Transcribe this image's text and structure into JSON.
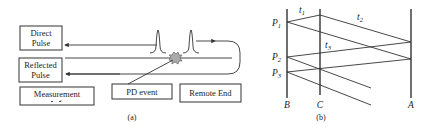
{
  "figure_a": {
    "caption": "(a)",
    "boxes": {
      "direct_pulse": [
        "Direct",
        "Pulse"
      ],
      "reflected_pulse": [
        "Reflected",
        "Pulse"
      ],
      "measurement": "Measurement",
      "pd_event": "PD event",
      "remote_end": "Remote End"
    },
    "icons": [
      "pulse-waveform-icon",
      "pulse-waveform-icon",
      "pd-event-burst-icon",
      "arrow-left-icon",
      "arrow-right-icon"
    ]
  },
  "figure_b": {
    "caption": "(b)",
    "axes": [
      "B",
      "C",
      "A"
    ],
    "points": [
      {
        "label": "P",
        "sub": "1"
      },
      {
        "label": "P",
        "sub": "2"
      },
      {
        "label": "P",
        "sub": "3"
      }
    ],
    "time_labels": [
      {
        "label": "t",
        "sub": "1"
      },
      {
        "label": "t",
        "sub": "2"
      },
      {
        "label": "t",
        "sub": "3"
      }
    ]
  },
  "colors": {
    "line": "#333333",
    "burst_fill": "#aaaaaa",
    "background": "#ffffff"
  }
}
